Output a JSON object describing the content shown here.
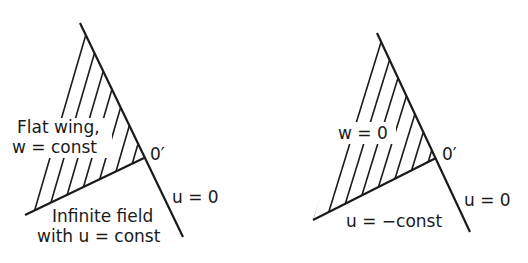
{
  "left_panel": {
    "region_label_line1": "Flat wing,",
    "region_label_line2": "w = const",
    "vertex_label": "0′",
    "edge_label": "u = 0",
    "field_label_line1": "Infinite field",
    "field_label_line2": "with u = const"
  },
  "right_panel": {
    "region_label": "w = 0",
    "vertex_label": "0′",
    "edge_label": "u = 0",
    "field_label": "u = −const"
  },
  "colors": {
    "ink": "#1a1a1a",
    "background": "#ffffff"
  }
}
